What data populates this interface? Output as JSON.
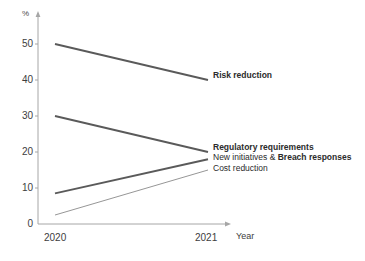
{
  "chart_data": {
    "type": "line",
    "title": "",
    "xlabel": "Year",
    "ylabel": "%",
    "categories": [
      "2020",
      "2021"
    ],
    "x": [
      2020,
      2021
    ],
    "ylim": [
      0,
      55
    ],
    "yticks": [
      0,
      10,
      20,
      30,
      40,
      50
    ],
    "ytick_labels": [
      "0",
      "10",
      "20",
      "30",
      "40",
      "50"
    ],
    "grid": false,
    "legend_position": "right-inline-end-of-line",
    "series": [
      {
        "name": "Risk reduction",
        "label_bold": true,
        "values": [
          50,
          40
        ],
        "color": "#5a5a5a",
        "line_width": 1.9
      },
      {
        "name": "Regulatory requirements",
        "label_bold": true,
        "values": [
          30,
          20
        ],
        "color": "#5a5a5a",
        "line_width": 1.9
      },
      {
        "name": "New initiatives & Breach responses",
        "label_bold_prefix": "New initiatives & ",
        "label_bold_suffix": "Breach responses",
        "values": [
          8.5,
          18
        ],
        "color": "#5a5a5a",
        "line_width": 1.9
      },
      {
        "name": "Cost reduction",
        "label_bold": false,
        "values": [
          2.5,
          15
        ],
        "color": "#8a8a8a",
        "line_width": 0.9
      }
    ]
  },
  "axes": {
    "unit_label": "%",
    "x_title": "Year",
    "y_tick_labels": [
      "50",
      "40",
      "30",
      "20",
      "10",
      "0"
    ],
    "x_tick_labels": [
      "2020",
      "2021"
    ],
    "axis_color": "#9a9a9a"
  },
  "labels": {
    "risk_reduction": "Risk reduction",
    "regulatory_requirements": "Regulatory requirements",
    "new_initiatives_prefix": "New initiatives & ",
    "new_initiatives_suffix": "Breach responses",
    "cost_reduction": "Cost reduction"
  }
}
